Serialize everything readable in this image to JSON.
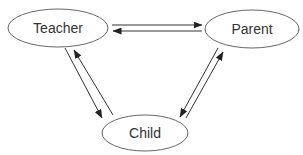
{
  "diagram": {
    "type": "relationship-diagram",
    "nodes": [
      {
        "id": "teacher",
        "label": "Teacher",
        "cx": 58,
        "cy": 28,
        "rx": 50,
        "ry": 19
      },
      {
        "id": "parent",
        "label": "Parent",
        "cx": 252,
        "cy": 29,
        "rx": 47,
        "ry": 19
      },
      {
        "id": "child",
        "label": "Child",
        "cx": 145,
        "cy": 133,
        "rx": 43,
        "ry": 18
      }
    ],
    "edges": [
      {
        "from": "teacher",
        "to": "parent",
        "x1": 112,
        "y1": 25,
        "x2": 202,
        "y2": 25
      },
      {
        "from": "parent",
        "to": "teacher",
        "x1": 202,
        "y1": 31,
        "x2": 113,
        "y2": 31
      },
      {
        "from": "teacher",
        "to": "child",
        "x1": 65,
        "y1": 48,
        "x2": 102,
        "y2": 118
      },
      {
        "from": "child",
        "to": "teacher",
        "x1": 113,
        "y1": 115,
        "x2": 74,
        "y2": 50
      },
      {
        "from": "parent",
        "to": "child",
        "x1": 218,
        "y1": 48,
        "x2": 180,
        "y2": 117
      },
      {
        "from": "child",
        "to": "parent",
        "x1": 186,
        "y1": 118,
        "x2": 223,
        "y2": 52
      }
    ],
    "colors": {
      "stroke": "#333333",
      "ellipse_stroke": "#555555",
      "text": "#333333",
      "background": "#ffffff"
    }
  }
}
